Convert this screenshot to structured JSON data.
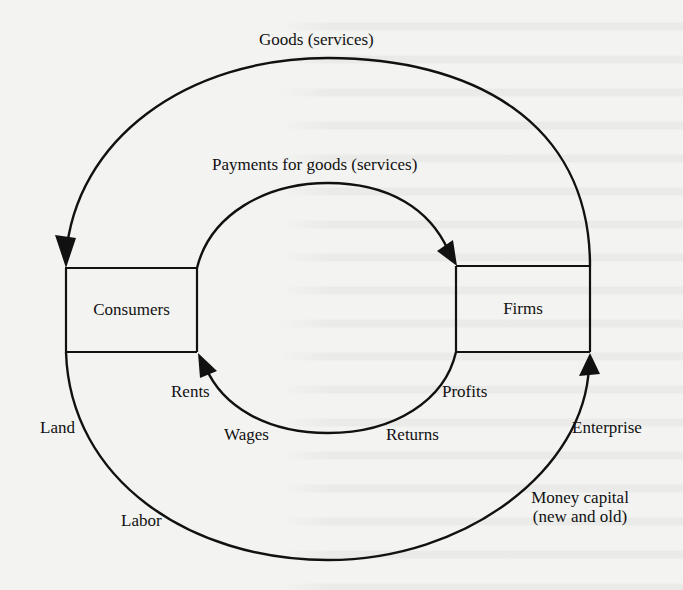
{
  "diagram": {
    "nodes": {
      "consumers": "Consumers",
      "firms": "Firms"
    },
    "outer_loop": {
      "top_label": "Goods (services)",
      "bottom_left_labels": [
        "Land",
        "Labor"
      ],
      "bottom_right_labels": [
        "Enterprise"
      ],
      "money_capital_line1": "Money capital",
      "money_capital_line2": "(new and old)"
    },
    "inner_loop": {
      "top_label": "Payments for goods (services)",
      "bottom_labels": {
        "rents": "Rents",
        "wages": "Wages",
        "returns": "Returns",
        "profits": "Profits"
      }
    },
    "flows": [
      {
        "from": "Firms",
        "to": "Consumers",
        "label": "Goods (services)",
        "loop": "outer-top"
      },
      {
        "from": "Consumers",
        "to": "Firms",
        "label": "Payments for goods (services)",
        "loop": "inner-top"
      },
      {
        "from": "Consumers",
        "to": "Firms",
        "label": "Land, Labor, Enterprise, Money capital (new and old)",
        "loop": "outer-bottom"
      },
      {
        "from": "Firms",
        "to": "Consumers",
        "label": "Rents, Wages, Returns, Profits",
        "loop": "inner-bottom"
      }
    ],
    "colors": {
      "stroke": "#111111",
      "background": "#f3f3f1",
      "text": "#111111"
    }
  }
}
